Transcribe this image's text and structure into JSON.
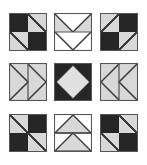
{
  "figure": {
    "rows": 3,
    "columns": 3,
    "tile_size_px": 38,
    "background_color": "#ffffff"
  },
  "palette": {
    "dark": "#262626",
    "light": "#d8d8d8",
    "white": "#ffffff",
    "outline": "#4a4a4a",
    "border": "#555555"
  },
  "blocks": [
    {
      "index": 1,
      "position": "row-1-col-1",
      "name": "four-patch-diagonal-black-corners",
      "description": "Four patch: dark top-left, light top-right with diagonal, light bottom-left with diagonal, dark bottom-right",
      "quadrants": [
        "dark",
        "light-diagonal-down",
        "light-diagonal-down",
        "dark"
      ]
    },
    {
      "index": 2,
      "position": "row-1-col-2",
      "name": "double-v-notch-down",
      "description": "Upper half light gray with white V notch, lower half white with light V outline pointing down",
      "quadrants": [
        "light-v-down",
        "white-v-down"
      ]
    },
    {
      "index": 3,
      "position": "row-1-col-3",
      "name": "four-patch-diagonal-light-corners",
      "description": "Four patch: light top-left with diagonal, dark top-right, dark bottom-left, light bottom-right with diagonal",
      "quadrants": [
        "light-diagonal-up",
        "dark",
        "dark",
        "light-diagonal-up"
      ]
    },
    {
      "index": 4,
      "position": "row-2-col-1",
      "name": "double-arrow-right",
      "description": "Two vertical halves each containing a right pointing triangle on light ground",
      "quadrants": [
        "arrow-right",
        "arrow-right"
      ]
    },
    {
      "index": 5,
      "position": "row-2-col-2",
      "name": "diamond-in-square",
      "description": "Dark square with a large light gray diamond centered inside",
      "quadrants": [
        "dark-with-light-diamond"
      ]
    },
    {
      "index": 6,
      "position": "row-2-col-3",
      "name": "double-arrow-left",
      "description": "Two vertical halves each containing a left pointing triangle on light ground",
      "quadrants": [
        "arrow-left",
        "arrow-left"
      ]
    },
    {
      "index": 7,
      "position": "row-3-col-1",
      "name": "four-patch-diagonal-light-corners-repeat",
      "description": "Four patch: light top-left with diagonal, dark top-right, dark bottom-left, light bottom-right with diagonal",
      "quadrants": [
        "light-diagonal-up",
        "dark",
        "dark",
        "light-diagonal-up"
      ]
    },
    {
      "index": 8,
      "position": "row-3-col-2",
      "name": "double-peak-up",
      "description": "Upper half white with light gray peak, lower half white with light gray peak pointing up",
      "quadrants": [
        "white-peak-up",
        "white-peak-up"
      ]
    },
    {
      "index": 9,
      "position": "row-3-col-3",
      "name": "four-patch-diagonal-black-corners-repeat",
      "description": "Four patch: dark top-left, light top-right with diagonal, light bottom-left with diagonal, dark bottom-right",
      "quadrants": [
        "dark",
        "light-diagonal-down",
        "light-diagonal-down",
        "dark"
      ]
    }
  ]
}
